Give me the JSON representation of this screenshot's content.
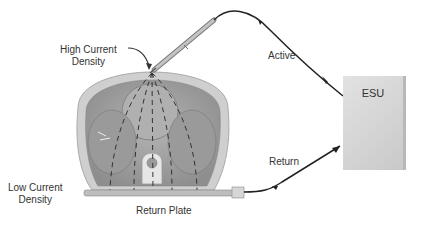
{
  "diagram": {
    "labels": {
      "high_current": [
        "High Current",
        "Density"
      ],
      "low_current": [
        "Low Current",
        "Density"
      ],
      "return_plate": "Return Plate",
      "active": "Active",
      "return": "Return",
      "esu": "ESU"
    },
    "colors": {
      "body_outer": "#c8c8c8",
      "body_inner": "#a9a9a9",
      "wire": "#222222",
      "esu_box": "#d4d4d4"
    }
  }
}
